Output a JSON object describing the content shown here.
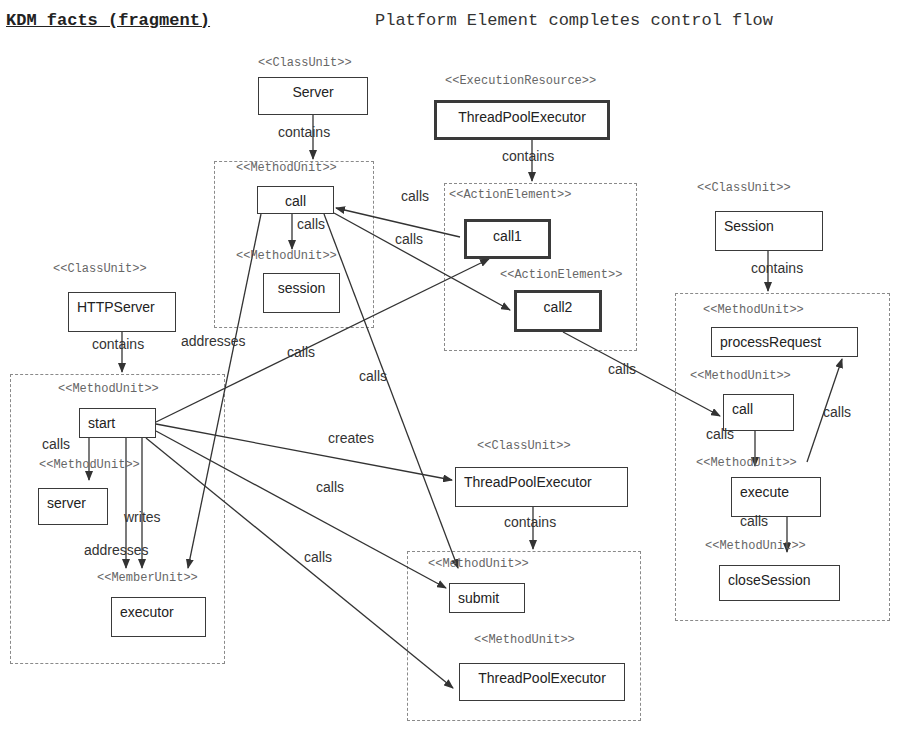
{
  "header": {
    "title": "KDM facts (fragment)",
    "subtitle": "Platform Element completes control flow"
  },
  "containers": [
    {
      "id": "server-call-mu",
      "x": 214,
      "y": 161,
      "w": 160,
      "h": 167
    },
    {
      "id": "tpe-actions",
      "x": 444,
      "y": 183,
      "w": 193,
      "h": 168
    },
    {
      "id": "session-mu",
      "x": 675,
      "y": 293,
      "w": 215,
      "h": 328
    },
    {
      "id": "httpserver-mu",
      "x": 10,
      "y": 374,
      "w": 215,
      "h": 290
    },
    {
      "id": "tpe-class-mu",
      "x": 407,
      "y": 551,
      "w": 234,
      "h": 170
    }
  ],
  "stereotypes": [
    {
      "text": "<<ClassUnit>>",
      "x": 258,
      "y": 56
    },
    {
      "text": "<<MethodUnit>>",
      "x": 236,
      "y": 161
    },
    {
      "text": "<<MethodUnit>>",
      "x": 236,
      "y": 249
    },
    {
      "text": "<<ExecutionResource>>",
      "x": 445,
      "y": 74
    },
    {
      "text": "<<ActionElement>>",
      "x": 449,
      "y": 188
    },
    {
      "text": "<<ActionElement>>",
      "x": 500,
      "y": 268
    },
    {
      "text": "<<ClassUnit>>",
      "x": 697,
      "y": 181
    },
    {
      "text": "<<MethodUnit>>",
      "x": 703,
      "y": 303
    },
    {
      "text": "<<MethodUnit>>",
      "x": 690,
      "y": 369
    },
    {
      "text": "<<MethodUnit>>",
      "x": 696,
      "y": 456
    },
    {
      "text": "<<MethodUnit>>",
      "x": 705,
      "y": 539
    },
    {
      "text": "<<ClassUnit>>",
      "x": 53,
      "y": 262
    },
    {
      "text": "<<MethodUnit>>",
      "x": 58,
      "y": 382
    },
    {
      "text": "<<MethodUnit>>",
      "x": 39,
      "y": 458
    },
    {
      "text": "<<MemberUnit>>",
      "x": 97,
      "y": 571
    },
    {
      "text": "<<ClassUnit>>",
      "x": 477,
      "y": 439
    },
    {
      "text": "<<MethodUnit>>",
      "x": 428,
      "y": 557
    },
    {
      "text": "<<MethodUnit>>",
      "x": 474,
      "y": 633
    }
  ],
  "nodes": [
    {
      "id": "server",
      "label": "Server",
      "x": 258,
      "y": 77,
      "w": 110,
      "h": 38,
      "center": true,
      "bold": false
    },
    {
      "id": "server-call",
      "label": "call",
      "x": 257,
      "y": 186,
      "w": 77,
      "h": 28,
      "center": true,
      "bold": false
    },
    {
      "id": "session-method",
      "label": "session",
      "x": 263,
      "y": 273,
      "w": 77,
      "h": 40,
      "center": true,
      "bold": false
    },
    {
      "id": "tpe-resource",
      "label": "ThreadPoolExecutor",
      "x": 434,
      "y": 100,
      "w": 176,
      "h": 40,
      "center": true,
      "bold": true
    },
    {
      "id": "call1",
      "label": "call1",
      "x": 464,
      "y": 219,
      "w": 87,
      "h": 40,
      "center": true,
      "bold": true
    },
    {
      "id": "call2",
      "label": "call2",
      "x": 514,
      "y": 290,
      "w": 88,
      "h": 42,
      "center": true,
      "bold": true
    },
    {
      "id": "session-class",
      "label": "Session",
      "x": 715,
      "y": 211,
      "w": 108,
      "h": 40,
      "center": false,
      "bold": false
    },
    {
      "id": "processRequest",
      "label": "processRequest",
      "x": 711,
      "y": 327,
      "w": 147,
      "h": 30,
      "center": false,
      "bold": false
    },
    {
      "id": "session-call",
      "label": "call",
      "x": 723,
      "y": 394,
      "w": 71,
      "h": 37,
      "center": false,
      "bold": false
    },
    {
      "id": "execute",
      "label": "execute",
      "x": 731,
      "y": 477,
      "w": 90,
      "h": 40,
      "center": false,
      "bold": false
    },
    {
      "id": "closeSession",
      "label": "closeSession",
      "x": 719,
      "y": 565,
      "w": 121,
      "h": 36,
      "center": false,
      "bold": false
    },
    {
      "id": "httpserver",
      "label": "HTTPServer",
      "x": 68,
      "y": 292,
      "w": 108,
      "h": 40,
      "center": false,
      "bold": false
    },
    {
      "id": "start",
      "label": "start",
      "x": 79,
      "y": 408,
      "w": 77,
      "h": 30,
      "center": false,
      "bold": false
    },
    {
      "id": "server-method",
      "label": "server",
      "x": 38,
      "y": 488,
      "w": 70,
      "h": 37,
      "center": false,
      "bold": false
    },
    {
      "id": "executor",
      "label": "executor",
      "x": 111,
      "y": 597,
      "w": 95,
      "h": 40,
      "center": false,
      "bold": false
    },
    {
      "id": "tpe-class",
      "label": "ThreadPoolExecutor",
      "x": 455,
      "y": 467,
      "w": 173,
      "h": 40,
      "center": false,
      "bold": false
    },
    {
      "id": "submit",
      "label": "submit",
      "x": 449,
      "y": 583,
      "w": 76,
      "h": 30,
      "center": false,
      "bold": false
    },
    {
      "id": "tpe-ctor",
      "label": "ThreadPoolExecutor",
      "x": 459,
      "y": 663,
      "w": 166,
      "h": 38,
      "center": true,
      "bold": false
    }
  ],
  "edges": [
    {
      "from": "server",
      "to": "server-call-mu",
      "kind": "contains",
      "pts": [
        [
          313,
          115
        ],
        [
          313,
          159
        ]
      ]
    },
    {
      "from": "server-call",
      "to": "session-method",
      "kind": "calls",
      "pts": [
        [
          292,
          214
        ],
        [
          292,
          249
        ]
      ]
    },
    {
      "from": "tpe-resource",
      "to": "tpe-actions",
      "kind": "contains",
      "pts": [
        [
          532,
          140
        ],
        [
          532,
          181
        ]
      ]
    },
    {
      "from": "call1",
      "to": "server-call",
      "kind": "calls",
      "pts": [
        [
          460,
          237
        ],
        [
          336,
          208
        ]
      ]
    },
    {
      "from": "server-call",
      "to": "call2",
      "kind": "calls",
      "pts": [
        [
          334,
          213
        ],
        [
          510,
          310
        ]
      ]
    },
    {
      "from": "server-call",
      "to": "executor",
      "kind": "addresses",
      "pts": [
        [
          261,
          214
        ],
        [
          188,
          568
        ]
      ]
    },
    {
      "from": "server-call",
      "to": "submit",
      "kind": "calls",
      "pts": [
        [
          324,
          214
        ],
        [
          458,
          568
        ]
      ]
    },
    {
      "from": "call2",
      "to": "session-call",
      "kind": "calls",
      "pts": [
        [
          563,
          332
        ],
        [
          720,
          416
        ]
      ]
    },
    {
      "from": "session-class",
      "to": "session-mu",
      "kind": "contains",
      "pts": [
        [
          768,
          251
        ],
        [
          768,
          291
        ]
      ]
    },
    {
      "from": "session-call",
      "to": "execute",
      "kind": "calls",
      "pts": [
        [
          755,
          431
        ],
        [
          755,
          466
        ]
      ]
    },
    {
      "from": "execute",
      "to": "processRequest",
      "kind": "calls",
      "pts": [
        [
          807,
          462
        ],
        [
          842,
          359
        ]
      ]
    },
    {
      "from": "execute",
      "to": "closeSession",
      "kind": "calls",
      "pts": [
        [
          787,
          517
        ],
        [
          787,
          552
        ]
      ]
    },
    {
      "from": "httpserver",
      "to": "httpserver-mu",
      "kind": "contains",
      "pts": [
        [
          122,
          332
        ],
        [
          122,
          372
        ]
      ]
    },
    {
      "from": "start",
      "to": "server-method",
      "kind": "calls",
      "pts": [
        [
          89,
          438
        ],
        [
          89,
          480
        ]
      ]
    },
    {
      "from": "start",
      "to": "executor",
      "kind": "addresses",
      "pts": [
        [
          126,
          438
        ],
        [
          126,
          568
        ]
      ]
    },
    {
      "from": "start",
      "to": "executor",
      "kind": "writes",
      "pts": [
        [
          142,
          438
        ],
        [
          142,
          568
        ]
      ]
    },
    {
      "from": "start",
      "to": "call1",
      "kind": "calls",
      "pts": [
        [
          156,
          422
        ],
        [
          489,
          259
        ]
      ]
    },
    {
      "from": "start",
      "to": "tpe-class",
      "kind": "creates",
      "pts": [
        [
          156,
          424
        ],
        [
          452,
          480
        ]
      ]
    },
    {
      "from": "start",
      "to": "submit",
      "kind": "calls",
      "pts": [
        [
          156,
          431
        ],
        [
          446,
          588
        ]
      ]
    },
    {
      "from": "start",
      "to": "tpe-ctor",
      "kind": "calls",
      "pts": [
        [
          146,
          438
        ],
        [
          453,
          688
        ]
      ]
    },
    {
      "from": "tpe-class",
      "to": "tpe-class-mu",
      "kind": "contains",
      "pts": [
        [
          533,
          507
        ],
        [
          533,
          549
        ]
      ]
    }
  ],
  "edge_labels": [
    {
      "text": "contains",
      "x": 278,
      "y": 124
    },
    {
      "text": "calls",
      "x": 297,
      "y": 216
    },
    {
      "text": "contains",
      "x": 502,
      "y": 148
    },
    {
      "text": "calls",
      "x": 401,
      "y": 188
    },
    {
      "text": "calls",
      "x": 395,
      "y": 231
    },
    {
      "text": "addresses",
      "x": 181,
      "y": 333
    },
    {
      "text": "calls",
      "x": 287,
      "y": 344
    },
    {
      "text": "calls",
      "x": 359,
      "y": 368
    },
    {
      "text": "calls",
      "x": 608,
      "y": 361
    },
    {
      "text": "contains",
      "x": 751,
      "y": 260
    },
    {
      "text": "calls",
      "x": 823,
      "y": 404
    },
    {
      "text": "calls",
      "x": 706,
      "y": 426
    },
    {
      "text": "calls",
      "x": 740,
      "y": 513
    },
    {
      "text": "contains",
      "x": 92,
      "y": 336
    },
    {
      "text": "calls",
      "x": 42,
      "y": 436
    },
    {
      "text": "writes",
      "x": 124,
      "y": 509
    },
    {
      "text": "addresses",
      "x": 84,
      "y": 542
    },
    {
      "text": "creates",
      "x": 328,
      "y": 430
    },
    {
      "text": "calls",
      "x": 316,
      "y": 479
    },
    {
      "text": "calls",
      "x": 304,
      "y": 549
    },
    {
      "text": "contains",
      "x": 504,
      "y": 514
    }
  ]
}
